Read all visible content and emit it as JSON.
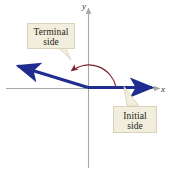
{
  "figure": {
    "kind": "angle-in-standard-position-diagram",
    "axes": {
      "y_label": "y",
      "x_label": "x",
      "axis_color": "#a9a9a4"
    },
    "rays": {
      "color": "#1e2d8f",
      "initial_side_name": "initial-side-ray",
      "terminal_side_name": "terminal-side-ray"
    },
    "arc": {
      "color": "#7b2230",
      "direction": "counterclockwise",
      "name": "angle-rotation-arc"
    },
    "callouts": [
      {
        "id": "terminal",
        "line1": "Terminal",
        "line2": "side"
      },
      {
        "id": "initial",
        "line1": "Initial",
        "line2": "side"
      }
    ]
  }
}
